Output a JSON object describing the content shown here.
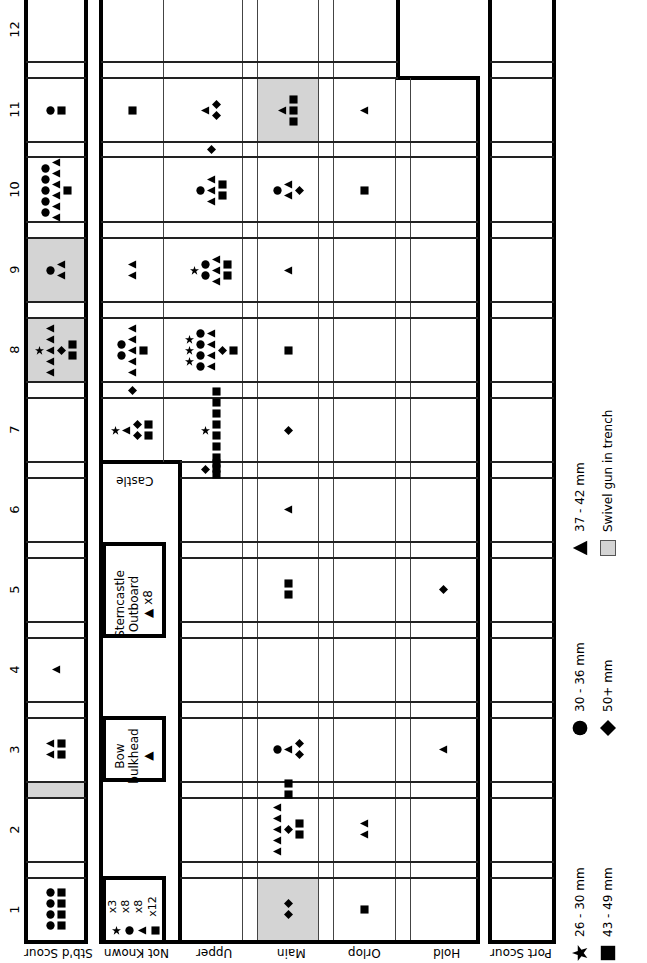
{
  "column_numbers": [
    "12",
    "11",
    "10",
    "9",
    "8",
    "7",
    "6",
    "5",
    "4",
    "3",
    "2",
    "1"
  ],
  "lanes": {
    "stbd_scour": "Stb'd Scour",
    "not_known": "Not Known",
    "upper": "Upper",
    "main": "Main",
    "orlop": "Orlop",
    "hold": "Hold",
    "port_scour": "Port Scour"
  },
  "castle_label": "Castle",
  "boxes": {
    "sterncastle": {
      "line1": "Sterncastle",
      "line2": "Outboard",
      "line3": "▲ x8"
    },
    "bow_bulkhead": {
      "line1": "Bow",
      "line2": "bulkhead",
      "line3": "▲"
    },
    "not_known_counts": [
      {
        "symbol": "star",
        "count": "x3"
      },
      {
        "symbol": "circle",
        "count": "x8"
      },
      {
        "symbol": "triangle",
        "count": "x8"
      },
      {
        "symbol": "square",
        "count": "x12"
      }
    ]
  },
  "legend": [
    {
      "symbol": "star",
      "label": "26 - 30 mm"
    },
    {
      "symbol": "circle",
      "label": "30 - 36 mm"
    },
    {
      "symbol": "triangle",
      "label": "37 - 42 mm"
    },
    {
      "symbol": "square",
      "label": "43 - 49 mm"
    },
    {
      "symbol": "diamond",
      "label": "50+ mm"
    },
    {
      "symbol": "swatch",
      "label": "Swivel gun in trench"
    }
  ],
  "colors": {
    "swivel_trench": "#d4d4d4",
    "ink": "#000000"
  },
  "cells": [
    {
      "col": "11",
      "lane": "stbd_scour",
      "symbols": [
        "square",
        "circle"
      ]
    },
    {
      "col": "10",
      "lane": "stbd_scour",
      "symbols": [
        "circle",
        "circle",
        "circle",
        "circle",
        "circle",
        "triangle",
        "triangle",
        "triangle",
        "triangle",
        "triangle",
        "triangle",
        "square"
      ]
    },
    {
      "col": "9",
      "lane": "stbd_scour",
      "swivel": true,
      "symbols": [
        "circle",
        "triangle",
        "triangle"
      ]
    },
    {
      "col": "8",
      "lane": "stbd_scour",
      "swivel": true,
      "symbols": [
        "star",
        "triangle",
        "triangle",
        "triangle",
        "triangle",
        "triangle",
        "diamond",
        "square",
        "square"
      ]
    },
    {
      "col": "4",
      "lane": "stbd_scour",
      "symbols": [
        "triangle"
      ]
    },
    {
      "col": "3",
      "lane": "stbd_scour",
      "symbols": [
        "triangle",
        "triangle",
        "square",
        "square"
      ]
    },
    {
      "col": "1",
      "lane": "stbd_scour",
      "symbols": [
        "circle",
        "circle",
        "circle",
        "circle",
        "square",
        "square",
        "square",
        "square"
      ]
    },
    {
      "col": "11",
      "lane": "castle",
      "symbols": [
        "square"
      ]
    },
    {
      "col": "8",
      "lane": "castle",
      "symbols": [
        "circle",
        "circle",
        "triangle",
        "triangle",
        "triangle",
        "triangle",
        "triangle",
        "square"
      ]
    },
    {
      "col": "8-7 gap",
      "lane": "castle",
      "symbols": [
        "diamond"
      ]
    },
    {
      "col": "7",
      "lane": "castle",
      "symbols": [
        "triangle",
        "star",
        "square",
        "square",
        "diamond",
        "diamond"
      ]
    },
    {
      "col": "11",
      "lane": "upper",
      "symbols": [
        "triangle",
        "diamond",
        "diamond"
      ]
    },
    {
      "col": "11-10 gap",
      "lane": "upper",
      "symbols": [
        "diamond"
      ]
    },
    {
      "col": "10",
      "lane": "upper",
      "symbols": [
        "circle",
        "triangle",
        "triangle",
        "triangle",
        "square",
        "square"
      ]
    },
    {
      "col": "9",
      "lane": "castle",
      "symbols": [
        "triangle",
        "triangle"
      ]
    },
    {
      "col": "9",
      "lane": "upper",
      "symbols": [
        "circle",
        "circle",
        "star",
        "triangle",
        "triangle",
        "triangle",
        "square",
        "square"
      ]
    },
    {
      "col": "8",
      "lane": "upper",
      "symbols": [
        "star",
        "star",
        "star",
        "circle",
        "circle",
        "circle",
        "circle",
        "triangle",
        "triangle",
        "triangle",
        "triangle",
        "diamond",
        "square"
      ]
    },
    {
      "col": "7",
      "lane": "upper",
      "symbols": [
        "star",
        "square",
        "square",
        "square",
        "square",
        "square",
        "square",
        "square",
        "square"
      ]
    },
    {
      "col": "7-6 gap",
      "lane": "upper",
      "symbols": [
        "square",
        "square",
        "diamond"
      ]
    },
    {
      "col": "11",
      "lane": "main",
      "swivel": true,
      "symbols": [
        "triangle",
        "square",
        "square",
        "square"
      ]
    },
    {
      "col": "10",
      "lane": "main",
      "symbols": [
        "circle",
        "triangle",
        "triangle",
        "diamond"
      ]
    },
    {
      "col": "9",
      "lane": "main",
      "symbols": [
        "triangle"
      ]
    },
    {
      "col": "8",
      "lane": "main",
      "symbols": [
        "square"
      ]
    },
    {
      "col": "7",
      "lane": "main",
      "symbols": [
        "diamond"
      ]
    },
    {
      "col": "6",
      "lane": "main",
      "symbols": [
        "triangle"
      ]
    },
    {
      "col": "5",
      "lane": "main",
      "symbols": [
        "square",
        "square"
      ]
    },
    {
      "col": "3",
      "lane": "main",
      "symbols": [
        "circle",
        "triangle",
        "diamond",
        "diamond"
      ]
    },
    {
      "col": "3-2 gap",
      "lane": "main",
      "symbols": [
        "square",
        "square"
      ]
    },
    {
      "col": "2",
      "lane": "main",
      "symbols": [
        "triangle",
        "triangle",
        "triangle",
        "triangle",
        "triangle",
        "diamond",
        "square",
        "square"
      ]
    },
    {
      "col": "1",
      "lane": "main",
      "swivel": true,
      "symbols": [
        "diamond",
        "diamond"
      ]
    },
    {
      "col": "11",
      "lane": "orlop",
      "symbols": [
        "triangle"
      ]
    },
    {
      "col": "10",
      "lane": "orlop",
      "symbols": [
        "square"
      ]
    },
    {
      "col": "2",
      "lane": "orlop",
      "symbols": [
        "triangle",
        "triangle"
      ]
    },
    {
      "col": "1",
      "lane": "orlop",
      "symbols": [
        "square"
      ]
    },
    {
      "col": "5",
      "lane": "hold",
      "symbols": [
        "diamond"
      ]
    },
    {
      "col": "3",
      "lane": "hold",
      "symbols": [
        "triangle"
      ]
    }
  ]
}
